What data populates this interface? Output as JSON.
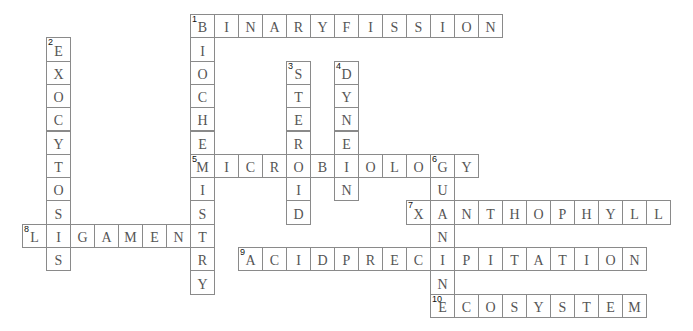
{
  "puzzle": {
    "grid": {
      "origin_x": 190,
      "origin_y": 14,
      "cell_w": 24,
      "cell_h": 23.3
    },
    "colors": {
      "border": "#8a8a8a",
      "letter": "#555555",
      "number": "#111111",
      "background": "#ffffff"
    },
    "words": [
      {
        "number": "1",
        "direction": "across",
        "answer": "BINARYFISSION",
        "col": 0,
        "row": 0
      },
      {
        "number": "1",
        "direction": "down",
        "answer": "BIOCHEMISTRY",
        "col": 0,
        "row": 0
      },
      {
        "number": "2",
        "direction": "down",
        "answer": "EXOCYTOSIS",
        "col": -6,
        "row": 1
      },
      {
        "number": "3",
        "direction": "down",
        "answer": "STEROID",
        "col": 4,
        "row": 2
      },
      {
        "number": "4",
        "direction": "down",
        "answer": "DYNEIN",
        "col": 6,
        "row": 2
      },
      {
        "number": "5",
        "direction": "across",
        "answer": "MICROBIOLOGY",
        "col": 0,
        "row": 6
      },
      {
        "number": "6",
        "direction": "down",
        "answer": "GUANINE",
        "col": 10,
        "row": 6
      },
      {
        "number": "7",
        "direction": "across",
        "answer": "XANTHOPHYLL",
        "col": 9,
        "row": 8
      },
      {
        "number": "8",
        "direction": "across",
        "answer": "LIGAMENT",
        "col": -7,
        "row": 9
      },
      {
        "number": "9",
        "direction": "across",
        "answer": "ACIDPRECIPITATION",
        "col": 2,
        "row": 10
      },
      {
        "number": "10",
        "direction": "across",
        "answer": "ECOSYSTEM",
        "col": 10,
        "row": 12
      }
    ]
  }
}
